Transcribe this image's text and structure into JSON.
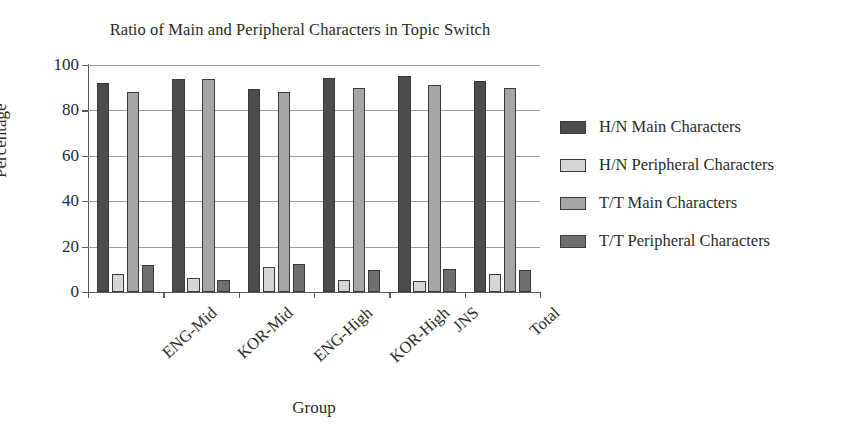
{
  "chart_data": {
    "type": "bar",
    "title": "Ratio of Main and Peripheral Characters in Topic Switch",
    "xlabel": "Group",
    "ylabel": "Percentage",
    "ylim": [
      0,
      100
    ],
    "yticks": [
      0,
      20,
      40,
      60,
      80,
      100
    ],
    "grid": "horizontal",
    "legend_position": "right",
    "categories": [
      "ENG-Mid",
      "KOR-Mid",
      "ENG-High",
      "KOR-High",
      "JNS",
      "Total"
    ],
    "series": [
      {
        "name": "H/N Main Characters",
        "color": "#4c4c4c",
        "values": [
          92,
          94,
          89.5,
          94.5,
          95,
          93
        ]
      },
      {
        "name": "H/N Peripheral Characters",
        "color": "#d6d6d6",
        "values": [
          8,
          6,
          11,
          5.5,
          5,
          8
        ]
      },
      {
        "name": "T/T Main Characters",
        "color": "#a6a6a6",
        "values": [
          88,
          94,
          88,
          90,
          91,
          90
        ]
      },
      {
        "name": "T/T Peripheral Characters",
        "color": "#6f6f6f",
        "values": [
          12,
          5.5,
          12.5,
          9.5,
          10,
          9.5
        ]
      }
    ]
  }
}
